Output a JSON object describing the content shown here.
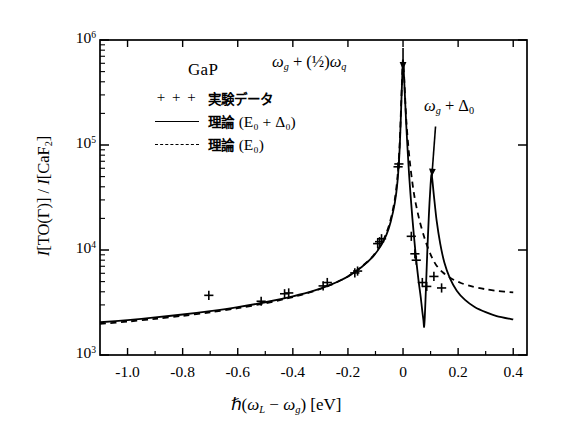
{
  "chart_data": {
    "type": "line",
    "title": "",
    "xlabel": "ℏ(ω_L − ω_g) [eV]",
    "ylabel": "I[TO(Γ)] / I[CaF2]",
    "xlim": [
      -1.1,
      0.45
    ],
    "ylim_log10": [
      3,
      6
    ],
    "xticks": [
      "-1.0",
      "-0.8",
      "-0.6",
      "-0.4",
      "-0.2",
      "0",
      "0.2",
      "0.4"
    ],
    "xtick_values": [
      -1.0,
      -0.8,
      -0.6,
      -0.4,
      -0.2,
      0,
      0.2,
      0.4
    ],
    "ytick_labels": [
      "10^3",
      "10^4",
      "10^5",
      "10^6"
    ],
    "ytick_values": [
      1000,
      10000,
      100000,
      1000000
    ],
    "yscale": "log",
    "grid": false,
    "legend_position": "upper-left-inside",
    "series": [
      {
        "name": "理論 (E0 + Δ0)",
        "style": "solid",
        "points": [
          [
            -1.1,
            2050
          ],
          [
            -1.0,
            2150
          ],
          [
            -0.9,
            2280
          ],
          [
            -0.8,
            2430
          ],
          [
            -0.7,
            2620
          ],
          [
            -0.6,
            2860
          ],
          [
            -0.5,
            3180
          ],
          [
            -0.4,
            3620
          ],
          [
            -0.32,
            4120
          ],
          [
            -0.26,
            4700
          ],
          [
            -0.2,
            5600
          ],
          [
            -0.15,
            6900
          ],
          [
            -0.11,
            8600
          ],
          [
            -0.08,
            11000
          ],
          [
            -0.06,
            14000
          ],
          [
            -0.045,
            18500
          ],
          [
            -0.03,
            28000
          ],
          [
            -0.02,
            45000
          ],
          [
            -0.012,
            95000
          ],
          [
            -0.006,
            260000
          ],
          [
            -0.002,
            520000
          ],
          [
            0.0,
            620000
          ],
          [
            0.004,
            430000
          ],
          [
            0.012,
            150000
          ],
          [
            0.022,
            52000
          ],
          [
            0.034,
            20000
          ],
          [
            0.046,
            9000
          ],
          [
            0.056,
            5200
          ],
          [
            0.064,
            3600
          ],
          [
            0.07,
            2600
          ],
          [
            0.074,
            2150
          ],
          [
            0.0765,
            1850
          ],
          [
            0.079,
            2300
          ],
          [
            0.083,
            4200
          ],
          [
            0.088,
            9500
          ],
          [
            0.094,
            22000
          ],
          [
            0.1,
            42000
          ],
          [
            0.104,
            52000
          ],
          [
            0.112,
            33000
          ],
          [
            0.122,
            19000
          ],
          [
            0.135,
            11500
          ],
          [
            0.15,
            7600
          ],
          [
            0.17,
            5400
          ],
          [
            0.195,
            4100
          ],
          [
            0.225,
            3350
          ],
          [
            0.26,
            2870
          ],
          [
            0.3,
            2560
          ],
          [
            0.34,
            2350
          ],
          [
            0.4,
            2180
          ]
        ]
      },
      {
        "name": "理論 (E0)",
        "style": "dashed",
        "points": [
          [
            -1.1,
            1980
          ],
          [
            -1.0,
            2080
          ],
          [
            -0.9,
            2210
          ],
          [
            -0.8,
            2360
          ],
          [
            -0.7,
            2550
          ],
          [
            -0.6,
            2790
          ],
          [
            -0.5,
            3110
          ],
          [
            -0.4,
            3560
          ],
          [
            -0.32,
            4080
          ],
          [
            -0.26,
            4680
          ],
          [
            -0.2,
            5600
          ],
          [
            -0.15,
            6950
          ],
          [
            -0.11,
            8700
          ],
          [
            -0.08,
            11300
          ],
          [
            -0.06,
            14600
          ],
          [
            -0.045,
            19500
          ],
          [
            -0.03,
            30000
          ],
          [
            -0.02,
            50000
          ],
          [
            -0.012,
            105000
          ],
          [
            -0.006,
            280000
          ],
          [
            -0.002,
            540000
          ],
          [
            0.0,
            640000
          ],
          [
            0.004,
            450000
          ],
          [
            0.012,
            170000
          ],
          [
            0.024,
            72000
          ],
          [
            0.04,
            34000
          ],
          [
            0.058,
            20000
          ],
          [
            0.076,
            13500
          ],
          [
            0.092,
            10200
          ],
          [
            0.104,
            8600
          ],
          [
            0.12,
            7200
          ],
          [
            0.145,
            6100
          ],
          [
            0.175,
            5350
          ],
          [
            0.21,
            4850
          ],
          [
            0.25,
            4500
          ],
          [
            0.295,
            4250
          ],
          [
            0.34,
            4080
          ],
          [
            0.4,
            3950
          ]
        ]
      },
      {
        "name": "実験データ",
        "style": "markers",
        "marker": "+",
        "points": [
          [
            -0.705,
            3700
          ],
          [
            -0.515,
            3250
          ],
          [
            -0.43,
            3830
          ],
          [
            -0.415,
            3900
          ],
          [
            -0.29,
            4550
          ],
          [
            -0.275,
            4900
          ],
          [
            -0.175,
            6050
          ],
          [
            -0.165,
            6300
          ],
          [
            -0.092,
            11500
          ],
          [
            -0.085,
            12000
          ],
          [
            -0.078,
            12800
          ],
          [
            -0.018,
            62000
          ],
          [
            -0.015,
            66000
          ],
          [
            0.03,
            13500
          ],
          [
            0.043,
            9200
          ],
          [
            0.048,
            8000
          ],
          [
            0.07,
            4900
          ],
          [
            0.086,
            4500
          ],
          [
            0.112,
            5600
          ],
          [
            0.14,
            4350
          ]
        ]
      }
    ],
    "annotations": [
      {
        "text": "ω_g + (½)ω_q",
        "x": 0.0,
        "note": "arrow points down to first resonance peak"
      },
      {
        "text": "ω_g + Δ_0",
        "x": 0.104,
        "note": "arrow points down to second resonance peak"
      }
    ]
  },
  "axes": {
    "ylabel_parts": {
      "i1": "I",
      "to": "[TO(Γ)] / ",
      "i2": "I",
      "caf": "[CaF",
      "caf_sub": "2",
      "caf_end": "]"
    },
    "xlabel_parts": {
      "hbar": "ℏ(",
      "omega": "ω",
      "sub_l": "L",
      "minus": " − ",
      "omega2": "ω",
      "sub_g": "g",
      "close": ") [eV]"
    },
    "yticks": [
      {
        "mantissa": "10",
        "exp": "6"
      },
      {
        "mantissa": "10",
        "exp": "5"
      },
      {
        "mantissa": "10",
        "exp": "4"
      },
      {
        "mantissa": "10",
        "exp": "3"
      }
    ],
    "xticks": [
      "-1.0",
      "-0.8",
      "-0.6",
      "-0.4",
      "-0.2",
      "0",
      "0.2",
      "0.4"
    ]
  },
  "legend": {
    "title": "GaP",
    "rows": [
      {
        "key": "+ + +",
        "key_type": "plus-markers",
        "label": "実験データ",
        "math": ""
      },
      {
        "key": "solid-line",
        "key_type": "solid-line",
        "label": "理論",
        "math": "(E₀ + Δ₀)"
      },
      {
        "key": "dashed-line",
        "key_type": "dashed-line",
        "label": "理論",
        "math": "(E₀)"
      }
    ]
  },
  "annotations": {
    "peak1": {
      "omega": "ω",
      "sub": "g",
      "plus": " + (½)",
      "omega2": "ω",
      "sub2": "q"
    },
    "peak2": {
      "omega": "ω",
      "sub": "g",
      "plus": " + Δ",
      "sub2": "0"
    }
  },
  "colors": {
    "curve": "#000000",
    "frame": "#000000",
    "background": "#ffffff"
  }
}
